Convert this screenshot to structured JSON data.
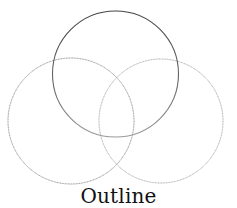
{
  "diagram": {
    "type": "venn",
    "caption": "Outline",
    "circles": [
      {
        "id": "top",
        "cx": 115.5,
        "cy": 74,
        "r": 63,
        "stroke": "#555555",
        "style": "solid"
      },
      {
        "id": "left",
        "cx": 71,
        "cy": 121,
        "r": 63,
        "stroke": "#8a8a8a",
        "style": "dotted"
      },
      {
        "id": "right",
        "cx": 161,
        "cy": 121,
        "r": 62,
        "stroke": "#a0a0a0",
        "style": "dotted"
      }
    ]
  }
}
